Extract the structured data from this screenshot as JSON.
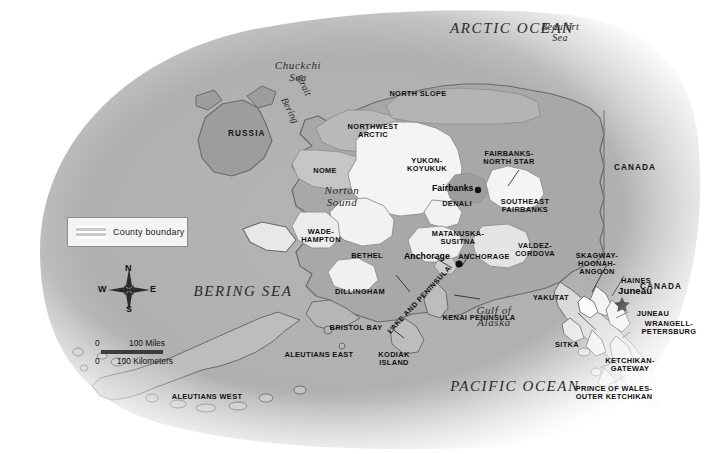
{
  "map": {
    "title": "Alaska Boroughs and Census Areas",
    "colors": {
      "land_dark": "#a8a8a8",
      "land_light": "#f2f2f2",
      "land_mid": "#c9c9c9",
      "coastline": "#6a6a6a",
      "background": "#ffffff",
      "text": "#141414"
    }
  },
  "legend": {
    "label": "County boundary",
    "swatch_name": "striped-boundary-swatch"
  },
  "compass": {
    "north": "N",
    "south": "S",
    "east": "E",
    "west": "W"
  },
  "scale": {
    "miles_zero": "0",
    "miles_value": "100 Miles",
    "km_zero": "0",
    "km_value": "100 Kilometers"
  },
  "oceans": [
    {
      "name": "ARCTIC OCEAN",
      "style": "ocean"
    },
    {
      "name": "PACIFIC OCEAN",
      "style": "ocean"
    },
    {
      "name": "BERING SEA",
      "style": "ocean"
    }
  ],
  "seas": [
    {
      "name": "Beaufort\nSea"
    },
    {
      "name": "Chuckchi\nSea"
    },
    {
      "name": "Norton\nSound"
    },
    {
      "name": "Gulf of\nAlaska"
    }
  ],
  "straits": [
    {
      "name": "Bering"
    },
    {
      "name": "Strait"
    }
  ],
  "countries": [
    {
      "name": "RUSSIA"
    },
    {
      "name": "CANADA"
    },
    {
      "name": "CANADA"
    }
  ],
  "cities": [
    {
      "name": "Fairbanks",
      "marker": "dot",
      "is_capital": false
    },
    {
      "name": "Anchorage",
      "marker": "dot",
      "is_capital": false
    },
    {
      "name": "Juneau",
      "marker": "star",
      "is_capital": true
    }
  ],
  "boroughs": [
    {
      "name": "NORTH SLOPE"
    },
    {
      "name": "NORTHWEST\nARCTIC"
    },
    {
      "name": "NOME"
    },
    {
      "name": "YUKON-\nKOYUKUK"
    },
    {
      "name": "FAIRBANKS-\nNORTH STAR"
    },
    {
      "name": "DENALI"
    },
    {
      "name": "SOUTHEAST\nFAIRBANKS"
    },
    {
      "name": "WADE-\nHAMPTON"
    },
    {
      "name": "BETHEL"
    },
    {
      "name": "MATANUSKA-\nSUSITNA"
    },
    {
      "name": "ANCHORAGE"
    },
    {
      "name": "VALDEZ-\nCORDOVA"
    },
    {
      "name": "DILLINGHAM"
    },
    {
      "name": "BRISTOL BAY"
    },
    {
      "name": "LAKE AND PENINSULA"
    },
    {
      "name": "KENAI PENINSULA"
    },
    {
      "name": "KODIAK\nISLAND"
    },
    {
      "name": "ALEUTIANS EAST"
    },
    {
      "name": "ALEUTIANS WEST"
    },
    {
      "name": "YAKUTAT"
    },
    {
      "name": "SKAGWAY-\nHOONAH-\nANGOON"
    },
    {
      "name": "HAINES"
    },
    {
      "name": "JUNEAU"
    },
    {
      "name": "WRANGELL-\nPETERSBURG"
    },
    {
      "name": "SITKA"
    },
    {
      "name": "KETCHIKAN-\nGATEWAY"
    },
    {
      "name": "PRINCE OF WALES-\nOUTER KETCHIKAN"
    }
  ]
}
